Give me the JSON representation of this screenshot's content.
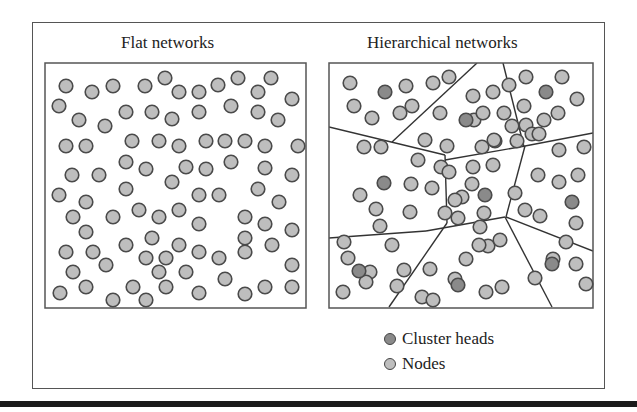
{
  "panels": {
    "flat": {
      "title": "Flat networks"
    },
    "hierarchical": {
      "title": "Hierarchical networks"
    }
  },
  "legend": {
    "items": [
      {
        "label": "Cluster heads",
        "color": "#8a8a8a"
      },
      {
        "label": "Nodes",
        "color": "#bebebe"
      }
    ]
  },
  "colors": {
    "node_fill": "#bebebe",
    "cluster_head_fill": "#8a8a8a",
    "stroke": "#4a4a4a",
    "frame": "#555555"
  },
  "flat_network": {
    "box": {
      "x": 45,
      "y": 63,
      "w": 261,
      "h": 245
    },
    "nodes": [
      [
        66,
        86
      ],
      [
        92,
        92
      ],
      [
        113,
        86
      ],
      [
        145,
        86
      ],
      [
        165,
        78
      ],
      [
        179,
        92
      ],
      [
        199,
        92
      ],
      [
        218,
        85
      ],
      [
        238,
        78
      ],
      [
        258,
        92
      ],
      [
        271,
        78
      ],
      [
        292,
        99
      ],
      [
        59,
        106
      ],
      [
        79,
        120
      ],
      [
        105,
        126
      ],
      [
        126,
        112
      ],
      [
        152,
        112
      ],
      [
        172,
        119
      ],
      [
        199,
        112
      ],
      [
        231,
        106
      ],
      [
        258,
        112
      ],
      [
        278,
        120
      ],
      [
        66,
        146
      ],
      [
        86,
        146
      ],
      [
        132,
        141
      ],
      [
        159,
        141
      ],
      [
        179,
        146
      ],
      [
        206,
        141
      ],
      [
        225,
        141
      ],
      [
        245,
        141
      ],
      [
        265,
        146
      ],
      [
        298,
        146
      ],
      [
        126,
        162
      ],
      [
        146,
        169
      ],
      [
        186,
        167
      ],
      [
        206,
        169
      ],
      [
        231,
        162
      ],
      [
        265,
        168
      ],
      [
        292,
        175
      ],
      [
        72,
        175
      ],
      [
        99,
        175
      ],
      [
        172,
        182
      ],
      [
        59,
        195
      ],
      [
        86,
        202
      ],
      [
        126,
        189
      ],
      [
        199,
        195
      ],
      [
        219,
        195
      ],
      [
        258,
        189
      ],
      [
        279,
        202
      ],
      [
        73,
        217
      ],
      [
        113,
        217
      ],
      [
        139,
        210
      ],
      [
        159,
        217
      ],
      [
        179,
        210
      ],
      [
        199,
        224
      ],
      [
        245,
        217
      ],
      [
        265,
        224
      ],
      [
        292,
        230
      ],
      [
        86,
        232
      ],
      [
        66,
        252
      ],
      [
        93,
        252
      ],
      [
        126,
        245
      ],
      [
        152,
        238
      ],
      [
        146,
        258
      ],
      [
        166,
        258
      ],
      [
        179,
        245
      ],
      [
        199,
        252
      ],
      [
        219,
        258
      ],
      [
        245,
        238
      ],
      [
        245,
        252
      ],
      [
        272,
        245
      ],
      [
        292,
        265
      ],
      [
        73,
        272
      ],
      [
        106,
        265
      ],
      [
        186,
        272
      ],
      [
        159,
        272
      ],
      [
        225,
        279
      ],
      [
        60,
        293
      ],
      [
        86,
        287
      ],
      [
        113,
        300
      ],
      [
        133,
        287
      ],
      [
        146,
        300
      ],
      [
        166,
        287
      ],
      [
        199,
        293
      ],
      [
        245,
        294
      ],
      [
        265,
        287
      ],
      [
        292,
        287
      ]
    ]
  },
  "hierarchical_network": {
    "box": {
      "x": 329,
      "y": 63,
      "w": 264,
      "h": 245
    },
    "cluster_lines": [
      [
        [
          477,
          63
        ],
        [
          392,
          142
        ]
      ],
      [
        [
          503,
          63
        ],
        [
          524,
          147
        ]
      ],
      [
        [
          329,
          127
        ],
        [
          445,
          155
        ]
      ],
      [
        [
          445,
          155
        ],
        [
          447,
          223
        ]
      ],
      [
        [
          445,
          160
        ],
        [
          525,
          146
        ]
      ],
      [
        [
          525,
          146
        ],
        [
          593,
          133
        ]
      ],
      [
        [
          525,
          146
        ],
        [
          506,
          217
        ]
      ],
      [
        [
          447,
          223
        ],
        [
          389,
          307
        ]
      ],
      [
        [
          329,
          238
        ],
        [
          426,
          231
        ]
      ],
      [
        [
          426,
          231
        ],
        [
          505,
          217
        ]
      ],
      [
        [
          505,
          217
        ],
        [
          552,
          307
        ]
      ],
      [
        [
          506,
          217
        ],
        [
          593,
          251
        ]
      ]
    ],
    "nodes": [
      [
        350,
        83
      ],
      [
        406,
        86
      ],
      [
        433,
        83
      ],
      [
        449,
        77
      ],
      [
        354,
        106
      ],
      [
        372,
        118
      ],
      [
        400,
        113
      ],
      [
        412,
        106
      ],
      [
        440,
        113
      ],
      [
        364,
        147
      ],
      [
        381,
        147
      ],
      [
        418,
        160
      ],
      [
        441,
        167
      ],
      [
        425,
        140
      ],
      [
        447,
        146
      ],
      [
        482,
        147
      ],
      [
        495,
        141
      ],
      [
        517,
        141
      ],
      [
        473,
        96
      ],
      [
        493,
        92
      ],
      [
        509,
        85
      ],
      [
        526,
        77
      ],
      [
        562,
        77
      ],
      [
        577,
        99
      ],
      [
        524,
        106
      ],
      [
        544,
        120
      ],
      [
        558,
        113
      ],
      [
        526,
        125
      ],
      [
        532,
        134
      ],
      [
        512,
        126
      ],
      [
        539,
        134
      ],
      [
        474,
        120
      ],
      [
        483,
        113
      ],
      [
        504,
        113
      ],
      [
        494,
        140
      ],
      [
        559,
        150
      ],
      [
        584,
        147
      ],
      [
        538,
        175
      ],
      [
        559,
        182
      ],
      [
        578,
        175
      ],
      [
        360,
        195
      ],
      [
        376,
        209
      ],
      [
        380,
        226
      ],
      [
        344,
        242
      ],
      [
        348,
        258
      ],
      [
        370,
        272
      ],
      [
        343,
        292
      ],
      [
        411,
        184
      ],
      [
        432,
        188
      ],
      [
        410,
        212
      ],
      [
        462,
        197
      ],
      [
        455,
        200
      ],
      [
        449,
        172
      ],
      [
        473,
        167
      ],
      [
        472,
        184
      ],
      [
        493,
        165
      ],
      [
        445,
        213
      ],
      [
        458,
        218
      ],
      [
        484,
        213
      ],
      [
        488,
        246
      ],
      [
        480,
        227
      ],
      [
        515,
        193
      ],
      [
        525,
        210
      ],
      [
        392,
        245
      ],
      [
        404,
        270
      ],
      [
        397,
        286
      ],
      [
        430,
        269
      ],
      [
        455,
        279
      ],
      [
        479,
        245
      ],
      [
        466,
        259
      ],
      [
        500,
        240
      ],
      [
        540,
        216
      ],
      [
        576,
        223
      ],
      [
        566,
        242
      ],
      [
        553,
        259
      ],
      [
        576,
        264
      ],
      [
        586,
        284
      ],
      [
        535,
        278
      ],
      [
        502,
        287
      ],
      [
        422,
        297
      ],
      [
        366,
        282
      ],
      [
        433,
        300
      ],
      [
        486,
        292
      ]
    ],
    "cluster_heads": [
      [
        385,
        92
      ],
      [
        466,
        120
      ],
      [
        546,
        92
      ],
      [
        384,
        183
      ],
      [
        485,
        195
      ],
      [
        572,
        202
      ],
      [
        359,
        271
      ],
      [
        458,
        285
      ],
      [
        552,
        264
      ]
    ]
  }
}
